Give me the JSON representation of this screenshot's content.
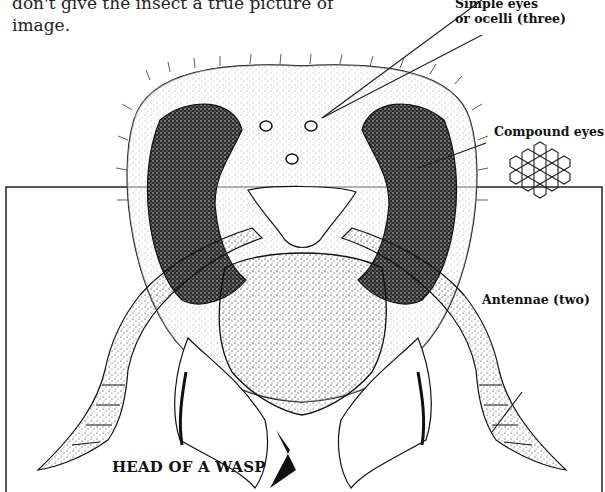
{
  "body_text": {
    "line1": "don't give the insect a true picture of",
    "line2": "image."
  },
  "figure": {
    "title": "HEAD OF A WASP",
    "labels": {
      "simple_eyes_line1": "Simple eyes",
      "simple_eyes_line2": "or ocelli (three)",
      "compound_eyes": "Compound eyes",
      "antennae": "Antennae (two)"
    },
    "colors": {
      "ink": "#111111",
      "paper": "#ffffff",
      "stipple": "#1a1a1a"
    }
  }
}
